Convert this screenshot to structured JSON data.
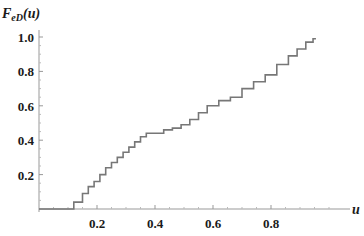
{
  "chart_data": {
    "type": "line",
    "subtype": "step",
    "title": "",
    "xlabel": "u",
    "ylabel": "F_eD(u)",
    "ylabel_display": {
      "main": "F",
      "sub": "eD",
      "arg": "(u)"
    },
    "xlim": [
      0,
      1.0
    ],
    "ylim": [
      0,
      1.05
    ],
    "x_ticks": [
      0.2,
      0.4,
      0.6,
      0.8
    ],
    "x_tick_labels": [
      "0.2",
      "0.4",
      "0.6",
      "0.8"
    ],
    "y_ticks": [
      0.2,
      0.4,
      0.6,
      0.8,
      1.0
    ],
    "y_tick_labels": [
      "0.2",
      "0.4",
      "0.6",
      "0.8",
      "1.0"
    ],
    "grid": false,
    "legend": null,
    "note": "Coordinates are estimated from the screenshot, not exact data.",
    "series": [
      {
        "name": "empirical CDF",
        "color": "#777777",
        "x": [
          0.0,
          0.11,
          0.12,
          0.15,
          0.17,
          0.19,
          0.21,
          0.23,
          0.25,
          0.27,
          0.29,
          0.31,
          0.33,
          0.35,
          0.37,
          0.4,
          0.43,
          0.46,
          0.49,
          0.52,
          0.55,
          0.58,
          0.62,
          0.66,
          0.7,
          0.74,
          0.78,
          0.82,
          0.86,
          0.89,
          0.92,
          0.945
        ],
        "y": [
          0.0,
          0.0,
          0.04,
          0.09,
          0.13,
          0.16,
          0.2,
          0.24,
          0.27,
          0.3,
          0.33,
          0.36,
          0.39,
          0.42,
          0.44,
          0.44,
          0.46,
          0.47,
          0.49,
          0.52,
          0.56,
          0.6,
          0.63,
          0.65,
          0.7,
          0.74,
          0.78,
          0.84,
          0.89,
          0.93,
          0.97,
          0.99
        ]
      }
    ]
  }
}
